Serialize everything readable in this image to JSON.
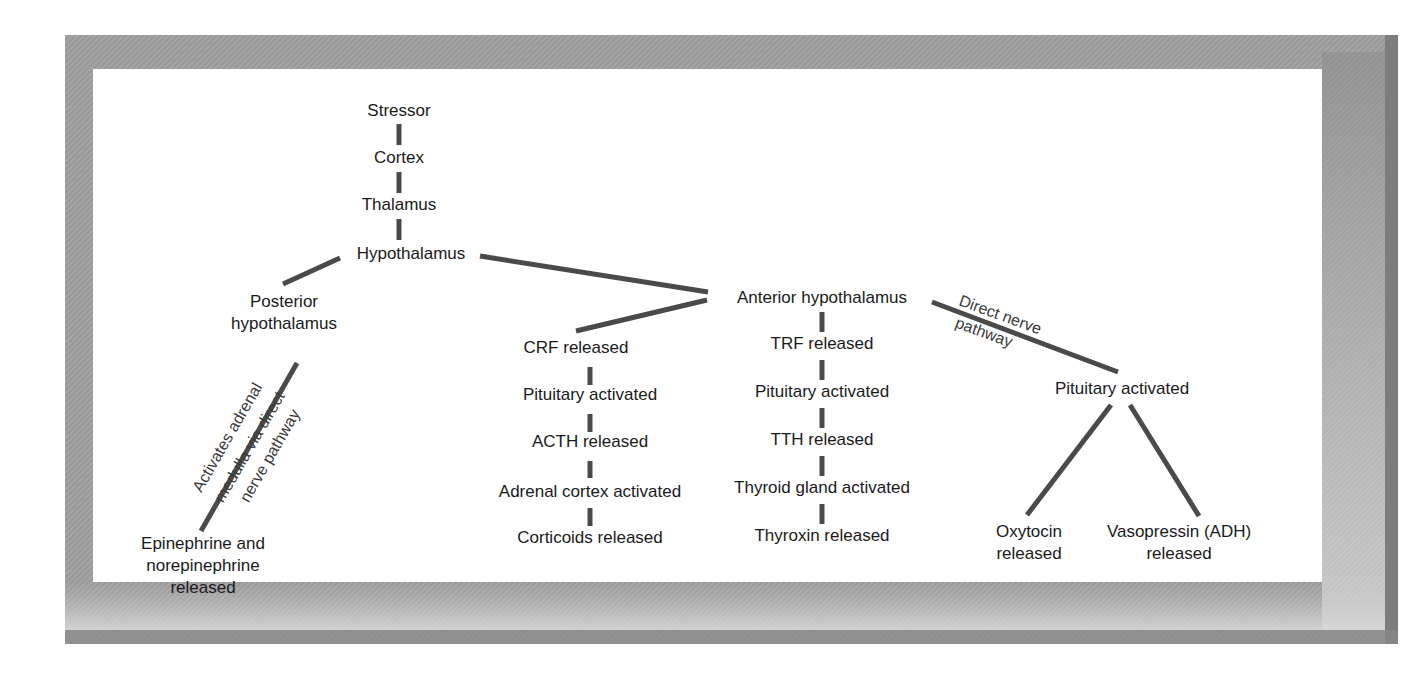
{
  "diagram": {
    "type": "flowchart-tree",
    "colors": {
      "frame_outer": "#8f8f8f",
      "frame_shadow": "#7a7a7a",
      "panel": "#ffffff",
      "line": "#4a4a4a",
      "text": "#1a1a1a",
      "edge_label": "#3a3a3a"
    },
    "nodes": {
      "stressor": {
        "lines": [
          "Stressor"
        ]
      },
      "cortex": {
        "lines": [
          "Cortex"
        ]
      },
      "thalamus": {
        "lines": [
          "Thalamus"
        ]
      },
      "hypothalamus": {
        "lines": [
          "Hypothalamus"
        ]
      },
      "posterior": {
        "lines": [
          "Posterior",
          "hypothalamus"
        ]
      },
      "epinephrine": {
        "lines": [
          "Epinephrine and",
          "norepinephrine",
          "released"
        ]
      },
      "anterior": {
        "lines": [
          "Anterior hypothalamus"
        ]
      },
      "crf": {
        "lines": [
          "CRF released"
        ]
      },
      "pit1": {
        "lines": [
          "Pituitary activated"
        ]
      },
      "acth": {
        "lines": [
          "ACTH released"
        ]
      },
      "adrenal": {
        "lines": [
          "Adrenal cortex activated"
        ]
      },
      "corticoids": {
        "lines": [
          "Corticoids released"
        ]
      },
      "trf": {
        "lines": [
          "TRF released"
        ]
      },
      "pit2": {
        "lines": [
          "Pituitary activated"
        ]
      },
      "tth": {
        "lines": [
          "TTH released"
        ]
      },
      "thyroid": {
        "lines": [
          "Thyroid gland activated"
        ]
      },
      "thyroxin": {
        "lines": [
          "Thyroxin released"
        ]
      },
      "pit3": {
        "lines": [
          "Pituitary activated"
        ]
      },
      "oxytocin": {
        "lines": [
          "Oxytocin",
          "released"
        ]
      },
      "vasopressin": {
        "lines": [
          "Vasopressin (ADH)",
          "released"
        ]
      }
    },
    "edges": [
      {
        "from": "stressor",
        "to": "cortex"
      },
      {
        "from": "cortex",
        "to": "thalamus"
      },
      {
        "from": "thalamus",
        "to": "hypothalamus"
      },
      {
        "from": "hypothalamus",
        "to": "posterior"
      },
      {
        "from": "hypothalamus",
        "to": "anterior"
      },
      {
        "from": "posterior",
        "to": "epinephrine",
        "label": [
          "Activates adrenal",
          "medulla via direct",
          "nerve pathway"
        ]
      },
      {
        "from": "anterior",
        "to": "crf"
      },
      {
        "from": "crf",
        "to": "pit1"
      },
      {
        "from": "pit1",
        "to": "acth"
      },
      {
        "from": "acth",
        "to": "adrenal"
      },
      {
        "from": "adrenal",
        "to": "corticoids"
      },
      {
        "from": "anterior",
        "to": "trf"
      },
      {
        "from": "trf",
        "to": "pit2"
      },
      {
        "from": "pit2",
        "to": "tth"
      },
      {
        "from": "tth",
        "to": "thyroid"
      },
      {
        "from": "thyroid",
        "to": "thyroxin"
      },
      {
        "from": "anterior",
        "to": "pit3",
        "label": [
          "Direct nerve",
          "pathway"
        ]
      },
      {
        "from": "pit3",
        "to": "oxytocin"
      },
      {
        "from": "pit3",
        "to": "vasopressin"
      }
    ]
  }
}
